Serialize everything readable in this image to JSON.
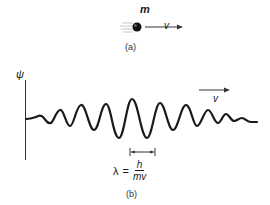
{
  "part_a": {
    "mass_label": "m",
    "velocity_label": "v",
    "caption": "(a)"
  },
  "part_b": {
    "axis_label": "ψ",
    "velocity_label": "v",
    "wavelength": {
      "symbol": "λ",
      "equals": "=",
      "numerator": "h",
      "denominator": "mv"
    },
    "caption": "(b)"
  },
  "colors": {
    "ink": "#1a1a1a",
    "background": "#ffffff"
  }
}
